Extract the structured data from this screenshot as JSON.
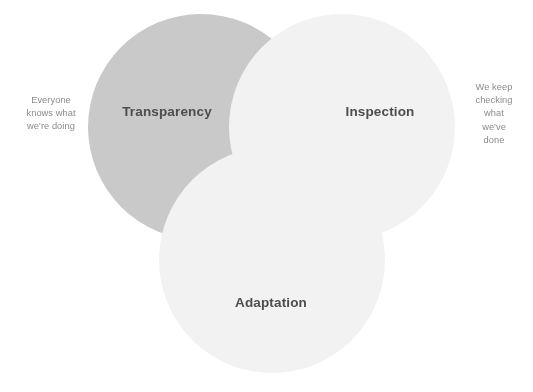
{
  "diagram": {
    "type": "venn",
    "set_count": 3,
    "background_color": "#ffffff",
    "label_color": "#4d4d4d",
    "note_color": "#8c8c8c",
    "circles": [
      {
        "id": "transparency",
        "label": "Transparency",
        "fill": "#c9c9c9",
        "cx": 201,
        "cy": 127,
        "r": 113,
        "label_x": 167,
        "label_y": 111
      },
      {
        "id": "inspection",
        "label": "Inspection",
        "fill": "#f2f2f2",
        "cx": 342,
        "cy": 127,
        "r": 113,
        "label_x": 380,
        "label_y": 111
      },
      {
        "id": "adaptation",
        "label": "Adaptation",
        "fill": "#f2f2f2",
        "cx": 272,
        "cy": 260,
        "r": 113,
        "label_x": 271,
        "label_y": 302
      }
    ],
    "annotations": [
      {
        "id": "left-note",
        "anchor": "transparency",
        "position": "left",
        "x": 51,
        "y": 114,
        "lines": [
          "Everyone",
          "knows what",
          "we're doing"
        ]
      },
      {
        "id": "right-note",
        "anchor": "inspection",
        "position": "right",
        "x": 494,
        "y": 114,
        "lines": [
          "We keep",
          "checking",
          "what we've",
          "done"
        ]
      }
    ]
  }
}
